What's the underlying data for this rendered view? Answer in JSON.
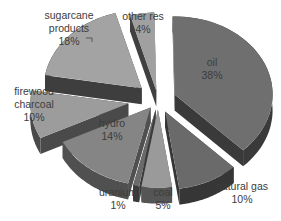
{
  "chart_data": {
    "type": "pie",
    "style": "3d-exploded",
    "title": "",
    "legend": "none",
    "categories": [
      "oil",
      "natural gas",
      "coal",
      "uranium",
      "hydro",
      "firewood charcoal",
      "sugarcane products",
      "other res"
    ],
    "values": [
      38,
      10,
      5,
      1,
      14,
      10,
      18,
      4
    ],
    "unit": "%",
    "slices": [
      {
        "name": "oil",
        "value": 38,
        "label_lines": [
          "oil",
          "38%"
        ],
        "top_color": "#6f6f6f",
        "side_color": "#3a3a3a"
      },
      {
        "name": "natural gas",
        "value": 10,
        "label_lines": [
          "natural gas",
          "10%"
        ],
        "top_color": "#6a6a6a",
        "side_color": "#363636"
      },
      {
        "name": "coal",
        "value": 5,
        "label_lines": [
          "coal",
          "5%"
        ],
        "top_color": "#9a9a9a",
        "side_color": "#555555"
      },
      {
        "name": "uranium",
        "value": 1,
        "label_lines": [
          "uranium",
          "1%"
        ],
        "top_color": "#6a6a6a",
        "side_color": "#3a3a3a"
      },
      {
        "name": "hydro",
        "value": 14,
        "label_lines": [
          "hydro",
          "14%"
        ],
        "top_color": "#858585",
        "side_color": "#505050"
      },
      {
        "name": "firewood charcoal",
        "value": 10,
        "label_lines": [
          "firewood",
          "charcoal",
          "10%"
        ],
        "top_color": "#9c9c9c",
        "side_color": "#4a4a4a"
      },
      {
        "name": "sugarcane products",
        "value": 18,
        "label_lines": [
          "sugarcane",
          "products",
          "18%"
        ],
        "top_color": "#a3a3a3",
        "side_color": "#3e3e3e"
      },
      {
        "name": "other res",
        "value": 4,
        "label_lines": [
          "other res",
          "4%"
        ],
        "top_color": "#a0a0a0",
        "side_color": "#404040"
      }
    ]
  },
  "labels": {
    "oil": [
      "oil",
      "38%"
    ],
    "natural_gas": [
      "natural gas",
      "10%"
    ],
    "coal": [
      "coal",
      "5%"
    ],
    "uranium": [
      "uranium",
      "1%"
    ],
    "hydro": [
      "hydro",
      "14%"
    ],
    "firewood": [
      "firewood",
      "charcoal",
      "10%"
    ],
    "sugarcane": [
      "sugarcane",
      "products",
      "18%"
    ],
    "other": [
      "other res",
      "4%"
    ]
  }
}
